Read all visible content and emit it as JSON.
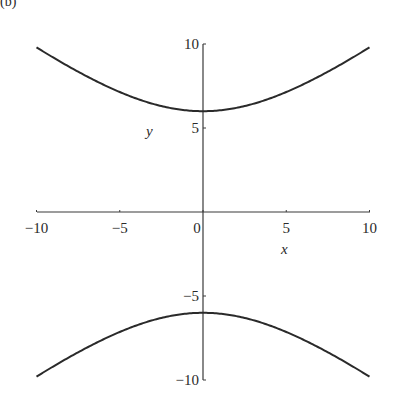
{
  "panel_label": "(b)",
  "chart_data": {
    "type": "line",
    "title": "",
    "xlabel": "x",
    "ylabel": "y",
    "xlim": [
      -10,
      10
    ],
    "ylim": [
      -10,
      10
    ],
    "grid": false,
    "legend": null,
    "x_ticks": [
      -10,
      -5,
      0,
      5,
      10
    ],
    "y_ticks": [
      -10,
      -5,
      5,
      10
    ],
    "x_tick_labels": [
      "-10",
      "-5",
      "0",
      "5",
      "10"
    ],
    "y_tick_labels": [
      "-10",
      "-5",
      "5",
      "10"
    ],
    "equation": "y^2/36 - x^2/60 = 1",
    "series": [
      {
        "name": "upper branch",
        "x": [
          -10,
          -8,
          -6,
          -4,
          -2,
          0,
          2,
          4,
          6,
          8,
          10
        ],
        "y": [
          9.8,
          8.53,
          7.55,
          6.71,
          6.06,
          6.0,
          6.06,
          6.71,
          7.55,
          8.53,
          9.8
        ]
      },
      {
        "name": "lower branch",
        "x": [
          -10,
          -8,
          -6,
          -4,
          -2,
          0,
          2,
          4,
          6,
          8,
          10
        ],
        "y": [
          -9.8,
          -8.53,
          -7.55,
          -6.71,
          -6.06,
          -6.0,
          -6.06,
          -6.71,
          -7.55,
          -8.53,
          -9.8
        ]
      }
    ],
    "color": "#2a2a2a"
  }
}
